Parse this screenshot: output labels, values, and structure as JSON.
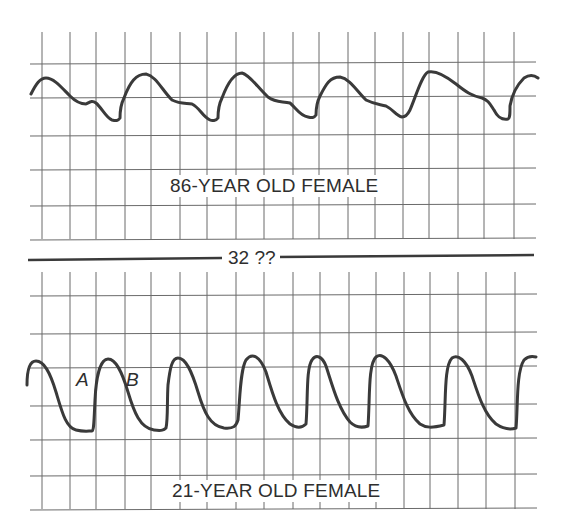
{
  "figure": {
    "top_panel": {
      "label": "86-YEAR OLD FEMALE",
      "description": "Damped arterial pulse waveform with shallow upstroke and notched descent"
    },
    "divider": {
      "label": "32 ??"
    },
    "bottom_panel": {
      "label": "21-YEAR OLD FEMALE",
      "description": "Sharp arterial pulse waveform with steep upstroke and smooth descent",
      "markers": [
        {
          "id": "A",
          "label": "A"
        },
        {
          "id": "B",
          "label": "B"
        }
      ]
    },
    "colors": {
      "grid": "#6a6a6a",
      "trace": "#3a3a3a",
      "text": "#2e2e2e",
      "background": "#ffffff"
    }
  }
}
